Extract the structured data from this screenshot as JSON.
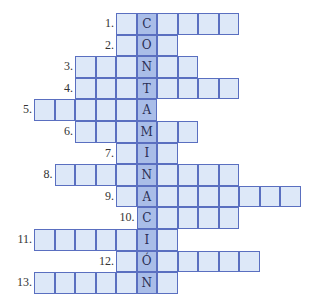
{
  "puzzle": {
    "hidden_word": "CONTAMINACIÓN",
    "colors": {
      "cell": "#dde8f8",
      "highlight": "#a9bde8",
      "border": "#5a6fc0"
    },
    "grid_origin_x": 34,
    "grid_origin_y": 13,
    "cell_w": 20.5,
    "cell_h": 21.6,
    "highlight_col": 5,
    "rows": [
      {
        "number": "1.",
        "start": 4,
        "end": 9,
        "letter": "C"
      },
      {
        "number": "2.",
        "start": 4,
        "end": 6,
        "letter": "O"
      },
      {
        "number": "3.",
        "start": 2,
        "end": 7,
        "letter": "N"
      },
      {
        "number": "4.",
        "start": 2,
        "end": 9,
        "letter": "T"
      },
      {
        "number": "5.",
        "start": 0,
        "end": 5,
        "letter": "A"
      },
      {
        "number": "6.",
        "start": 2,
        "end": 7,
        "letter": "M"
      },
      {
        "number": "7.",
        "start": 4,
        "end": 6,
        "letter": "I"
      },
      {
        "number": "8.",
        "start": 1,
        "end": 9,
        "letter": "N"
      },
      {
        "number": "9.",
        "start": 4,
        "end": 12,
        "letter": "A"
      },
      {
        "number": "10.",
        "start": 5,
        "end": 9,
        "letter": "C"
      },
      {
        "number": "11.",
        "start": 0,
        "end": 6,
        "letter": "I"
      },
      {
        "number": "12.",
        "start": 4,
        "end": 10,
        "letter": "Ó"
      },
      {
        "number": "13.",
        "start": 0,
        "end": 6,
        "letter": "N"
      }
    ]
  }
}
